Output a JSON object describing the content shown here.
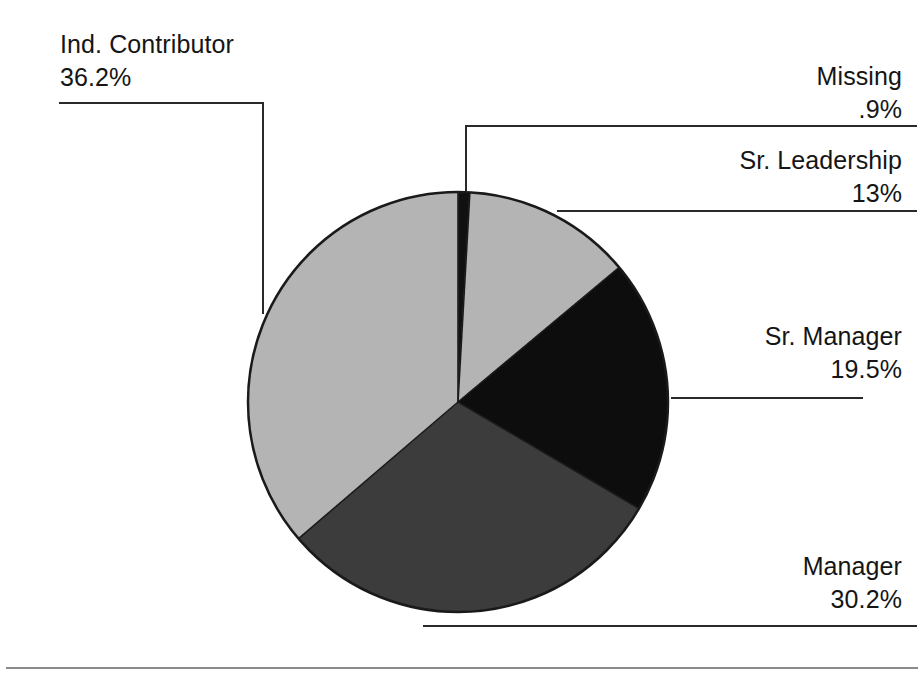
{
  "chart_data": {
    "type": "pie",
    "title": "",
    "subtitle": "",
    "xlabel": "",
    "ylabel": "",
    "legend_position": "none",
    "grid": false,
    "units": "percent",
    "start_angle_deg": 0,
    "direction": "clockwise",
    "total_labeled_percent": "99.8",
    "categories": [
      "Missing",
      "Sr. Leadership",
      "Sr. Manager",
      "Manager",
      "Ind. Contributor"
    ],
    "values": [
      0.9,
      13,
      19.5,
      30.2,
      36.2
    ],
    "value_labels": [
      ".9%",
      "13%",
      "19.5%",
      "30.2%",
      "36.2%"
    ],
    "colors": [
      "#111111",
      "#b4b4b4",
      "#0d0d0d",
      "#3c3c3c",
      "#b4b4b4"
    ],
    "slices": [
      {
        "name": "Missing",
        "value": 0.9,
        "value_label": ".9%",
        "color": "#111111",
        "start_deg": 0,
        "end_deg": 3.24
      },
      {
        "name": "Sr. Leadership",
        "value": 13,
        "value_label": "13%",
        "color": "#b4b4b4",
        "start_deg": 3.24,
        "end_deg": 50.04
      },
      {
        "name": "Sr. Manager",
        "value": 19.5,
        "value_label": "19.5%",
        "color": "#0d0d0d",
        "start_deg": 50.04,
        "end_deg": 120.24
      },
      {
        "name": "Manager",
        "value": 30.2,
        "value_label": "30.2%",
        "color": "#3c3c3c",
        "start_deg": 120.24,
        "end_deg": 228.96
      },
      {
        "name": "Ind. Contributor",
        "value": 36.2,
        "value_label": "36.2%",
        "color": "#b4b4b4",
        "start_deg": 228.96,
        "end_deg": 359.28
      }
    ]
  },
  "labels": {
    "ind_contributor": {
      "name": "Ind. Contributor",
      "value": "36.2%"
    },
    "missing": {
      "name": "Missing",
      "value": ".9%"
    },
    "sr_leadership": {
      "name": "Sr. Leadership",
      "value": "13%"
    },
    "sr_manager": {
      "name": "Sr. Manager",
      "value": "19.5%"
    },
    "manager": {
      "name": "Manager",
      "value": "30.2%"
    }
  },
  "style": {
    "background": "#ffffff",
    "text_color": "#151515",
    "leader_line_color": "#2a2a2a",
    "pie_outline_color": "#1a1a1a",
    "light_gray": "#b4b4b4",
    "mid_gray": "#3c3c3c",
    "black": "#0d0d0d",
    "missing_black": "#111111"
  }
}
